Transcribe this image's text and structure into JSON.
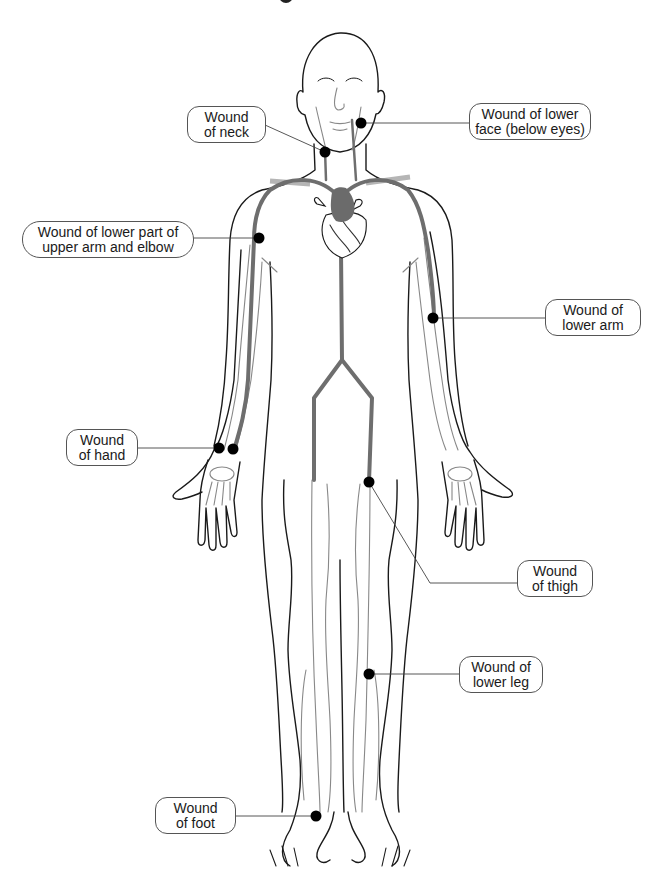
{
  "figure": {
    "colors": {
      "outline": "#1a1a1a",
      "artery": "#6e6e6e",
      "vein": "#888888",
      "clavicle": "#b5b5b5",
      "wound_dot": "#000000",
      "label_border": "#555555"
    }
  },
  "labels": [
    {
      "id": "neck",
      "line1": "Wound",
      "line2": "of neck"
    },
    {
      "id": "lower-face",
      "line1": "Wound of lower",
      "line2": "face (below eyes)"
    },
    {
      "id": "upper-arm-elbow",
      "line1": "Wound of lower part of",
      "line2": "upper arm and elbow"
    },
    {
      "id": "lower-arm",
      "line1": "Wound of",
      "line2": "lower arm"
    },
    {
      "id": "hand",
      "line1": "Wound",
      "line2": "of hand"
    },
    {
      "id": "thigh",
      "line1": "Wound",
      "line2": "of thigh"
    },
    {
      "id": "lower-leg",
      "line1": "Wound of",
      "line2": "lower leg"
    },
    {
      "id": "foot",
      "line1": "Wound",
      "line2": "of foot"
    }
  ]
}
